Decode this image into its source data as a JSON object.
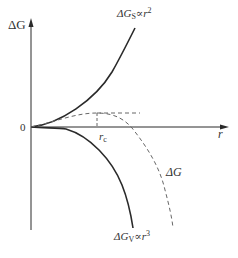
{
  "figure": {
    "type": "nucleation-free-energy-diagram",
    "axes": {
      "y_label": "ΔG",
      "x_label": "r",
      "origin_label": "0"
    },
    "curves": [
      {
        "id": "surface",
        "label_main": "ΔG",
        "label_sub": "S",
        "label_rel": "∝r",
        "label_exp": "2",
        "style": "solid",
        "description": "surface energy term, positive, grows as r squared"
      },
      {
        "id": "volume",
        "label_main": "ΔG",
        "label_sub": "V",
        "label_rel": "∝r",
        "label_exp": "3",
        "style": "solid",
        "description": "volume energy term, negative, falls as r cubed"
      },
      {
        "id": "total",
        "label_main": "ΔG",
        "style": "dashed",
        "description": "total free energy, maximum at critical radius"
      }
    ],
    "critical_radius": {
      "label_main": "r",
      "label_sub": "c"
    },
    "colors": {
      "line": "#2a2a2a",
      "dashed": "#666666",
      "text": "#333333",
      "background": "#ffffff"
    }
  }
}
